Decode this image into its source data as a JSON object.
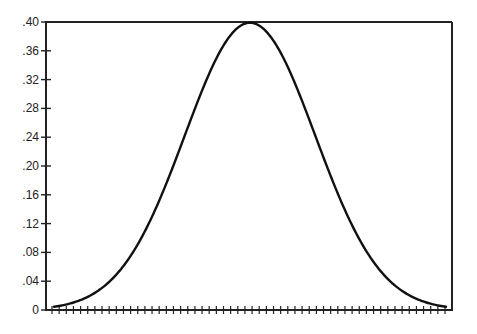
{
  "chart_data": {
    "type": "line",
    "title": "",
    "xlabel": "",
    "ylabel": "",
    "xlim": [
      -3,
      3
    ],
    "ylim": [
      0,
      0.4
    ],
    "grid": false,
    "legend": null,
    "yticks": [
      0,
      0.04,
      0.08,
      0.12,
      0.16,
      0.2,
      0.24,
      0.28,
      0.32,
      0.36,
      0.4
    ],
    "ytick_labels": [
      "0",
      ".04",
      ".08",
      ".12",
      ".16",
      ".20",
      ".24",
      ".28",
      ".32",
      ".36",
      ".40"
    ],
    "xtick_count": 56,
    "xtick_labels": [],
    "series": [
      {
        "name": "density",
        "color": "#111111",
        "x": [
          -3.0,
          -2.5,
          -2.0,
          -1.5,
          -1.0,
          -0.5,
          0.0,
          0.5,
          1.0,
          1.5,
          2.0,
          2.5,
          3.0
        ],
        "y": [
          0.0044,
          0.0175,
          0.054,
          0.1295,
          0.242,
          0.3521,
          0.3989,
          0.3521,
          0.242,
          0.1295,
          0.054,
          0.0175,
          0.0044
        ]
      }
    ]
  },
  "style": {
    "axis_color": "#222222",
    "curve_color": "#111111",
    "background": "#ffffff"
  }
}
